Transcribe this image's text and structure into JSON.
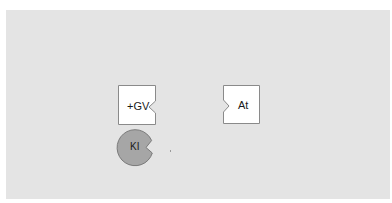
{
  "diagram": {
    "background_color": "#e4e4e4",
    "nodes": [
      {
        "id": "gv",
        "label": "+GV",
        "shape": "square-with-right-notch",
        "fill": "#ffffff",
        "stroke": "#8a8a8a"
      },
      {
        "id": "at",
        "label": "At",
        "shape": "square-with-left-notch",
        "fill": "#ffffff",
        "stroke": "#8a8a8a"
      },
      {
        "id": "ki",
        "label": "KI",
        "shape": "circle-with-notch",
        "fill": "#a6a6a6",
        "stroke": "#7a7a7a"
      }
    ]
  }
}
